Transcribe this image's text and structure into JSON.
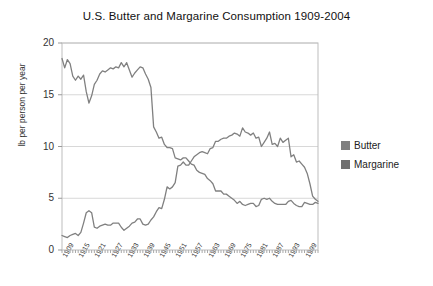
{
  "chart_data": {
    "type": "line",
    "title": "U.S. Butter and Margarine Consumption 1909-2004",
    "xlabel": "",
    "ylabel": "lb per person per year",
    "ylim": [
      0,
      20
    ],
    "xlim": [
      1909,
      2004
    ],
    "yticks": [
      "0",
      "5",
      "10",
      "15",
      "20"
    ],
    "ytick_values": [
      0,
      5,
      10,
      15,
      20
    ],
    "grid": true,
    "grid_axis": "y",
    "legend_position": "right",
    "xtick_labels": [
      "1909",
      "1915",
      "1921",
      "1927",
      "1933",
      "1939",
      "1945",
      "1951",
      "1957",
      "1963",
      "1969",
      "1975",
      "1981",
      "1987",
      "1993",
      "1999"
    ],
    "xtick_values": [
      1909,
      1915,
      1921,
      1927,
      1933,
      1939,
      1945,
      1951,
      1957,
      1963,
      1969,
      1975,
      1981,
      1987,
      1993,
      1999
    ],
    "x": [
      1909,
      1910,
      1911,
      1912,
      1913,
      1914,
      1915,
      1916,
      1917,
      1918,
      1919,
      1920,
      1921,
      1922,
      1923,
      1924,
      1925,
      1926,
      1927,
      1928,
      1929,
      1930,
      1931,
      1932,
      1933,
      1934,
      1935,
      1936,
      1937,
      1938,
      1939,
      1940,
      1941,
      1942,
      1943,
      1944,
      1945,
      1946,
      1947,
      1948,
      1949,
      1950,
      1951,
      1952,
      1953,
      1954,
      1955,
      1956,
      1957,
      1958,
      1959,
      1960,
      1961,
      1962,
      1963,
      1964,
      1965,
      1966,
      1967,
      1968,
      1969,
      1970,
      1971,
      1972,
      1973,
      1974,
      1975,
      1976,
      1977,
      1978,
      1979,
      1980,
      1981,
      1982,
      1983,
      1984,
      1985,
      1986,
      1987,
      1988,
      1989,
      1990,
      1991,
      1992,
      1993,
      1994,
      1995,
      1996,
      1997,
      1998,
      1999,
      2000,
      2001,
      2002,
      2003,
      2004
    ],
    "series": [
      {
        "name": "Butter",
        "color": "#808080",
        "values": [
          18.5,
          17.6,
          18.4,
          18.0,
          16.8,
          16.4,
          16.8,
          16.5,
          16.9,
          15.3,
          14.2,
          14.9,
          16.0,
          16.4,
          17.0,
          17.3,
          17.2,
          17.4,
          17.6,
          17.5,
          17.7,
          17.6,
          18.1,
          17.7,
          18.1,
          17.4,
          16.7,
          17.1,
          17.4,
          17.7,
          17.6,
          17.0,
          16.5,
          15.7,
          11.9,
          11.4,
          10.8,
          10.9,
          10.2,
          9.9,
          9.9,
          9.8,
          8.9,
          8.8,
          8.7,
          8.9,
          8.9,
          8.6,
          8.3,
          8.2,
          7.7,
          7.5,
          7.4,
          7.3,
          6.9,
          6.7,
          6.4,
          5.7,
          5.7,
          5.7,
          5.4,
          5.4,
          5.2,
          5.0,
          4.8,
          4.5,
          4.7,
          4.4,
          4.3,
          4.4,
          4.5,
          4.5,
          4.2,
          4.3,
          4.9,
          5.0,
          4.9,
          5.0,
          4.7,
          4.5,
          4.4,
          4.4,
          4.4,
          4.4,
          4.7,
          4.8,
          4.5,
          4.3,
          4.2,
          4.2,
          4.6,
          4.5,
          4.4,
          4.4,
          4.6,
          4.5
        ]
      },
      {
        "name": "Margarine",
        "color": "#808080",
        "values": [
          1.4,
          1.3,
          1.2,
          1.4,
          1.5,
          1.6,
          1.4,
          1.7,
          2.6,
          3.6,
          3.8,
          3.6,
          2.2,
          2.1,
          2.3,
          2.4,
          2.5,
          2.4,
          2.4,
          2.6,
          2.6,
          2.6,
          2.2,
          1.9,
          2.1,
          2.3,
          2.6,
          2.7,
          3.0,
          3.0,
          2.5,
          2.4,
          2.5,
          2.9,
          3.2,
          3.7,
          4.1,
          4.0,
          4.9,
          6.1,
          5.9,
          6.1,
          6.5,
          8.1,
          8.2,
          8.5,
          8.2,
          8.2,
          8.6,
          9.0,
          9.2,
          9.4,
          9.5,
          9.4,
          9.3,
          9.8,
          9.9,
          10.5,
          10.5,
          10.7,
          10.8,
          10.8,
          11.0,
          11.1,
          11.3,
          11.2,
          11.0,
          11.8,
          11.4,
          11.3,
          11.1,
          11.3,
          10.8,
          10.9,
          10.0,
          10.4,
          10.8,
          11.4,
          10.2,
          10.3,
          10.0,
          10.8,
          10.4,
          10.6,
          10.8,
          9.0,
          9.2,
          8.5,
          8.6,
          8.3,
          8.0,
          7.4,
          6.4,
          5.2,
          4.9,
          4.7
        ]
      }
    ]
  },
  "legend": {
    "items": [
      {
        "label": "Butter",
        "color": "#808080"
      },
      {
        "label": "Margarine",
        "color": "#707070"
      }
    ]
  }
}
